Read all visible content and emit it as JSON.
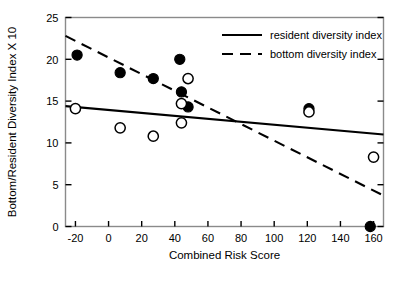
{
  "chart_data": {
    "type": "scatter",
    "title": "",
    "xlabel": "Combined Risk Score",
    "ylabel": "Bottom/Resident Diversity Index X 10",
    "xlim": [
      -26,
      166
    ],
    "ylim": [
      0,
      25
    ],
    "xticks": [
      -20,
      0,
      20,
      40,
      60,
      80,
      100,
      120,
      140,
      160
    ],
    "xtick_labels": [
      "-20",
      "0",
      "20",
      "40",
      "60",
      "80",
      "100",
      "120",
      "140",
      "160"
    ],
    "yticks": [
      0,
      5,
      10,
      15,
      20,
      25
    ],
    "ytick_labels": [
      "0",
      "5",
      "10",
      "15",
      "20",
      "25"
    ],
    "grid": false,
    "legend_position": "top-right-inside",
    "series": [
      {
        "name": "bottom diversity index",
        "marker": "filled-circle",
        "color": "#000000",
        "points": [
          {
            "x": -19,
            "y": 20.5
          },
          {
            "x": 7,
            "y": 18.4
          },
          {
            "x": 27,
            "y": 17.7
          },
          {
            "x": 43,
            "y": 20.0
          },
          {
            "x": 44,
            "y": 16.1
          },
          {
            "x": 48,
            "y": 14.3
          },
          {
            "x": 121,
            "y": 14.1
          },
          {
            "x": 158,
            "y": 0.0
          }
        ],
        "fit_line": {
          "style": "dashed",
          "x_start": -26,
          "y_start": 22.8,
          "x_end": 166,
          "y_end": 3.7
        }
      },
      {
        "name": "resident diversity index",
        "marker": "open-circle",
        "color": "#000000",
        "points": [
          {
            "x": -20,
            "y": 14.1
          },
          {
            "x": 7,
            "y": 11.8
          },
          {
            "x": 27,
            "y": 10.8
          },
          {
            "x": 44,
            "y": 14.7
          },
          {
            "x": 44,
            "y": 12.4
          },
          {
            "x": 48,
            "y": 17.7
          },
          {
            "x": 121,
            "y": 13.7
          },
          {
            "x": 160,
            "y": 8.3
          }
        ],
        "fit_line": {
          "style": "solid",
          "x_start": -26,
          "y_start": 14.4,
          "x_end": 166,
          "y_end": 11.0
        }
      }
    ],
    "legend_entries": [
      {
        "label": "resident diversity index",
        "style": "solid"
      },
      {
        "label": "bottom diversity index",
        "style": "dashed"
      }
    ]
  }
}
